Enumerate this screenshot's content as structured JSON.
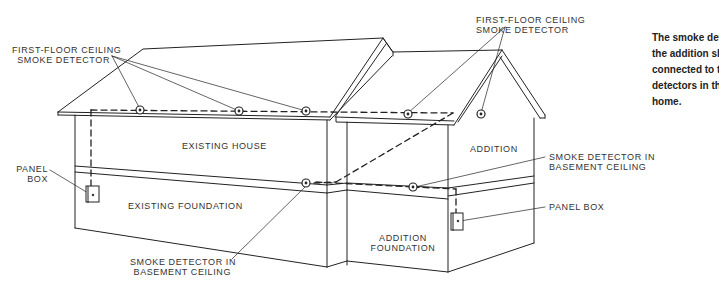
{
  "diagram": {
    "labels": {
      "first_floor_left": [
        "FIRST-FLOOR CEILING",
        "SMOKE DETECTOR"
      ],
      "first_floor_right": [
        "FIRST-FLOOR CEILING",
        "SMOKE DETECTOR"
      ],
      "existing_house": "EXISTING HOUSE",
      "addition": "ADDITION",
      "panel_box_left": [
        "PANEL",
        "BOX"
      ],
      "existing_foundation": "EXISTING FOUNDATION",
      "addition_foundation": [
        "ADDITION",
        "FOUNDATION"
      ],
      "basement_left": [
        "SMOKE DETECTOR IN",
        "BASEMENT CEILING"
      ],
      "basement_right": [
        "SMOKE DETECTOR IN",
        "BASEMENT CEILING"
      ],
      "panel_box_right": "PANEL BOX"
    },
    "note": {
      "lines": [
        "The smoke detectors in",
        "the addition should be",
        "connected to the smoke",
        "detectors in the existing",
        "home."
      ]
    },
    "colors": {
      "line": "#222222",
      "text": "#333333",
      "background": "#ffffff"
    }
  }
}
